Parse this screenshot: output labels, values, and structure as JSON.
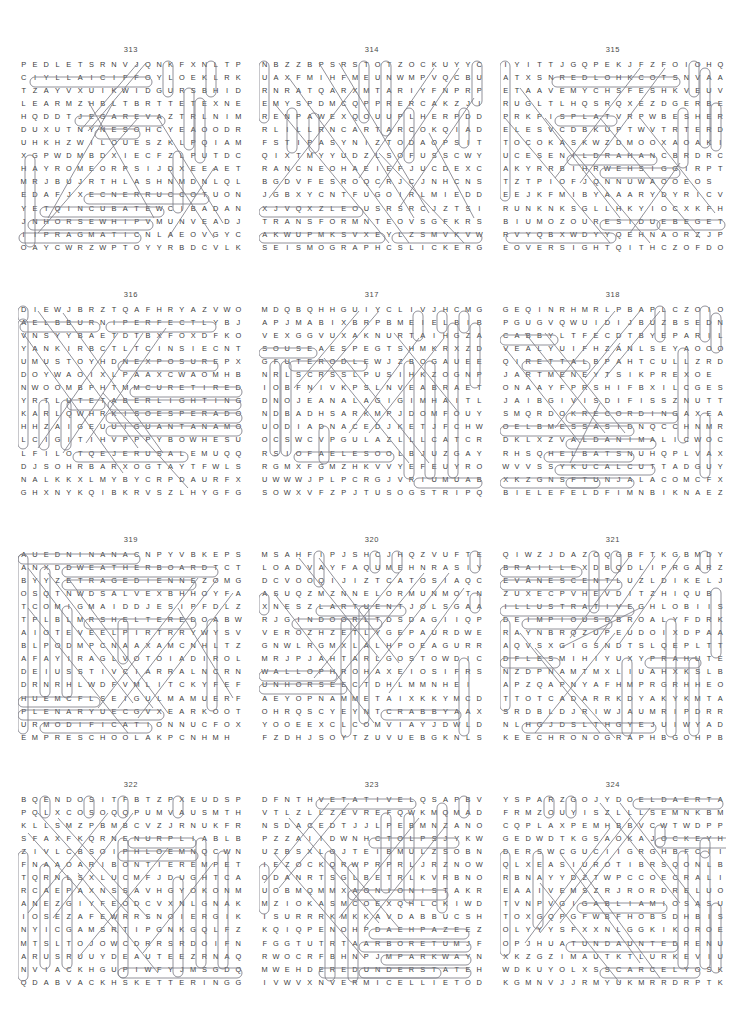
{
  "page": {
    "type": "word-search-puzzle-page",
    "columns": 3,
    "rows": 4,
    "grid_width": 20,
    "grid_height": 15
  },
  "puzzles": [
    {
      "number": "313",
      "rows": [
        "PEDLETSRNVJQNKFXNLTP",
        "CIYLLAICIFFOYLOEKLRK",
        "TZAYVXUIKWIDGURSBHID",
        "LEARMZHBLTBRTTETEXNE",
        "HQDDTJEGAREVAZTRLNIM",
        "DUXUTNYNESOHCYEAOODR",
        "UHKHZWILOUESZKLPQIAM",
        "XGPWDMBDXIECFZLPUTDC",
        "HAYROMEORPSIJDXEEAET",
        "MRJBUJRTHLASHNMDNLQL",
        "EDAFJXECNERRUCCOTUON",
        "YETQINCUBATEWCIBADAN",
        "JNHORSEWHIPVMUNVEADJ",
        "IIPRAGMATICNLAEOVGYC",
        "OAYCWRZWPTOYYRBDCVLK"
      ],
      "found_words": [
        "OFFICIALLY",
        "AVERAGE",
        "CHOSEN",
        "CURRENCE",
        "INCUBATE",
        "HORSEWHIP",
        "PRAGMATIC"
      ]
    },
    {
      "number": "314",
      "rows": [
        "NBZZBPSRSTOTZOCKUYYC",
        "UAXFMIHFMEUNWMPVQCBU",
        "RNRATQARXMTARIYFNPRP",
        "EMYSPDMCQPPRERCAKZJI",
        "RENPAWEXQOUUPLHERPDD",
        "RLILLRNCARTARCOKQIAD",
        "FSTIPASYNIZTODAOPSIT",
        "QIXTMYYUDZLSOFUSSCWY",
        "RANCNEOHAEIEFJUCDEXC",
        "BGDVFESROQCRJCJNHCNS",
        "JGBXYCNTFUGOIRLMIEDD",
        "XJVQXZLEOUSRSRCJZTSI",
        "TRANSFORMNTEOVSGFKRS",
        "AKWUPMKSVXEYLZSMVKVW",
        "SEISMOGRAPHCSLICKERG"
      ],
      "found_words": [
        "TRANSFORM",
        "SEISMOGRAPH",
        "SLICKER"
      ]
    },
    {
      "number": "315",
      "rows": [
        "IYITTJGQPEKJFZFOIOHQ",
        "ATXSNREDLOHKCOTSNVAA",
        "ETAAVEMYCHSFESHKVEUV",
        "RUGLTLHQSRQXEZDGERBE",
        "PRKPISPLATVRPWBESHER",
        "ELESVCDBKUPTWVTRTERD",
        "TOCOKASKWZDMOOXAOAKI",
        "UCESENILDRAHANCBRDRC",
        "AKYRRBIHRWEHSIGGIRPT",
        "TZTPIOFJQNNUWAOOEOS",
        "EEJKFMIBYAAARYDYRICV",
        "RUNKNKSGLLHKYIOCXKFH",
        "BIUMOZOURESIDUEBEGET",
        "RVYQBXWDYYQEHNAORZJP",
        "EOVERSIGHTQITHCZOFDO"
      ],
      "found_words": [
        "STOCKHOLDER",
        "SPLAT",
        "HARDLINES",
        "RIGGISH",
        "RESIDUE",
        "BEGET",
        "OVERSIGHT"
      ]
    },
    {
      "number": "316",
      "rows": [
        "DIEWJBRZTQAFHRYAZVWO",
        "AELBBURNIPERFECTLYBJ",
        "VNSYYBAETDTBXFOXDFKO",
        "YANKIRBCTLTCINSIECNT",
        "UMUSTOYHDNEXPOSUREPX",
        "DOYWAOIXLPAAXCWAOMHB",
        "NWOOMBPHTMMCURETIRED",
        "YRTLUTETABERLIGHTING",
        "KARLQWHRKISOESPERADO",
        "HHZAIGEUUIGUANTANAMO",
        "LCIGITIHVPPPYBOWHESU",
        "LFILOTQEJERUSALEMUQQ",
        "DJSOHRBARXOGTAYTFWLS",
        "NALKKXLMYBYCRPDAURFX",
        "GHXNYKQIBKRVSZLHYGFG"
      ],
      "found_words": [
        "RUBBLE",
        "PERFECTLY",
        "EXPOSURE",
        "RETIRED",
        "RATABLE",
        "LIGHTING",
        "DESPERADO",
        "GUANTANAMO",
        "JERUSALEM"
      ]
    },
    {
      "number": "317",
      "rows": [
        "MDQBQHHGUIYCLIVJHCMG",
        "APJMABIXBRPBMEIELBIB",
        "VEXGGVUXAKNURTAIHGZA",
        "SOUSEAESPEGTSHMKRXZD",
        "GFUTERODLEWJZBOGAUEE",
        "NRLSCRSSLPUSIHKZOGNP",
        "IOBFNIVKPSLNVEABRAET",
        "DNOJEANALAGIGIMHAITL",
        "NDBADHSARKMPJDOMFOUY",
        "UODIADNACEDJKETJFCHW",
        "OCSWCVPGULAZLLLCATCR",
        "RSIOFAELESOOLBJUZGAY",
        "RGMXFGMZHKVVYEFEUYRO",
        "UWWWJPLPCRGJVRIUMUAB",
        "SOWXVFZPJTUSOGSTRIPQ"
      ],
      "found_words": [
        "SOUSE",
        "TEROD",
        "LOOSELEAF",
        "STRIP",
        "BLEIB"
      ]
    },
    {
      "number": "318",
      "rows": [
        "GEQINRHMRLPBAPLCZOIO",
        "PGUGVQWUIDIJBUZBSEDN",
        "CABBYLTFECDTBYEPARIL",
        "VEALYUIFHZANLSEYAOOO",
        "QIRETTALBPAHTCULLZRD",
        "JARTMENEYTSIKPREXOE",
        "ONAAYFPRSHIFBXILCGES",
        "JAIBGIVISDIFISSZNUTT",
        "SMQRDOKRECORDINGAXEA",
        "OELBMESSASIDNQCCHNMR",
        "DKLXZVALDANIMALICWOC",
        "RHSQHELBATSNUHQPLVAX",
        "WVVSSYKUCALCUTTADGUY",
        "XKZGNSFTUNJALACOMCFX",
        "BIELEFELDFIMNBIKNAEZ"
      ],
      "found_words": [
        "CABBY",
        "RATTLE",
        "RECORDING",
        "DISASSEMBLE",
        "ANIMAL",
        "UNSTABLE",
        "CALCUTTA",
        "TUNJA",
        "BIELEFELD"
      ]
    },
    {
      "number": "319",
      "rows": [
        "AUEDNINANACNPYVBKEPS",
        "ANXDDWEATHERBOARDTCT",
        "BYYZETRAGEDIENNEZOMG",
        "OSQTNWDSALVEXBHHOYFA",
        "TCOMIGMAIDDJESIPFDLZ",
        "TPLBLMRSHELTEREDOABW",
        "AIOTEVEELPIRTRRYWYSV",
        "BLPODMPCNAAXAMCNHLTZ",
        "AFAYIRAGLVOTOIADIROL",
        "DEIUSSTIVCIARRALNCRN",
        "DRNRHLWDFVMLITCKYFEF",
        "HUEMCFLSEIGULMAMUERF",
        "PLENARYUECGVXEARKOOT",
        "URMODIFICATIONNUCFOX",
        "EMPRESCHOOLAKPCNHMH"
      ],
      "found_words": [
        "ANANINDEUA",
        "WEATHERBOARD",
        "TRAGEDIENNE",
        "SHELTERED",
        "PLENARY",
        "MODIFICATION",
        "PRESCHOOL"
      ]
    },
    {
      "number": "320",
      "rows": [
        "MSAHFIPJSHCJHQZVUFTE",
        "LOADVAYFAQUMEHNRASIY",
        "DCVOOQIJIZTCATOSIAQC",
        "ASUQZMZNNELORMUNMOTN",
        "XNESZLARTUENTJOLSGAA",
        "RJGINDOORLTDSDAGIIQP",
        "VEROZHZETLYGEPAURDWE",
        "GNWLRGMXLALHPOEAGURR",
        "MRJPJAHTARLGOSTOWDIC",
        "WALLOPHROHAXEIOSIFRS",
        "UNHORSEECTDHLMMNHEI",
        "AEYOPNAMMETAIXKKYMCD",
        "OHRQSCYEYNTCRABBYAAX",
        "YOOEEXCLCOMVIAYJDWLD",
        "FZDHJSOYTZUVUEBGKNLS"
      ],
      "found_words": [
        "NEUTRAL",
        "INDOOR",
        "WALLOP",
        "UNHORSE",
        "CRABBY"
      ]
    },
    {
      "number": "321",
      "rows": [
        "QIWZJDAZOQGBFTKGBMDY",
        "BRAILLEXDBQDLIPRGARZ",
        "EVANESCENTLUZLDIKELJ",
        "ZUXECPVHEVDITZHIQUB",
        "ILLUSTRATIVEGHLOBIIS",
        "DEIMPIOUSDBROALYFDRK",
        "RAYNBRQZUPEUDOIXDPAA",
        "AQVSXGIGSNDTSLQEPLTT",
        "DFLESMIHIYUXYPRAHUTE",
        "NZDPNAMTMXLIUAHXKSLB",
        "APZQAPNYAFHMPRGRHHEO",
        "TTOTCADARRKDYAKYKMTA",
        "SRDBLDJRIWJAUMRIPDRR",
        "NLHGJDSLTHGYEJUIWYAD",
        "KEECHRONOGRAPHBGOHPB"
      ],
      "found_words": [
        "BRAILLE",
        "EVANESCENT",
        "ILLUSTRATIVE",
        "IMPIOUS",
        "HIMSELF",
        "HARPY",
        "CHRONOGRAPH"
      ]
    },
    {
      "number": "322",
      "rows": [
        "BQENDOSITFBTZPXEUDSP",
        "PQLXCOSOQQPUMVAUSMTH",
        "KLLSMZPBMBCVZJRNUKFR",
        "SFAXFKQRNENURPLIABLB",
        "ZIVLCBSOIPHLOEMNQCWN",
        "FNAAOARIBONTIEREMPET",
        "TQRNLSXLUCMFJDUGHTCA",
        "RCAEPAXNSSAVHGYOKONM",
        "ANEZGIYFEODCVXNLGNAK",
        "IOSEZAFEWRRSNOIERGIK",
        "NYICGAMSRTIPGNKGQLFZ",
        "MTSLTOJOWCDRRSRDOIFN",
        "ARUSRUUYDEAUTEEZRNAQ",
        "NVIACKHGUPIWFYJMSGDQ",
        "QDABVACKHSKETTERINGG"
      ],
      "found_words": [
        "PRUNE",
        "PHLOEM",
        "FRONTIER",
        "KETTERING",
        "PLIABLE"
      ]
    },
    {
      "number": "323",
      "rows": [
        "DFNTHVETATIVELQSAPBV",
        "VTLZLLZEVREFQWKMQMAD",
        "NSDACEDTJJLPEBMNZANO",
        "PZZAIIDWNHCTOLPSJYKW",
        "UZBSXLOJTEIBMULZSOBN",
        "IEZOCKQRWPRPRLJRZNOW",
        "ODANRTSGLBETRLKVRBNOA",
        "UOBMQMMXAONIONISTAKR",
        "MZIOKASMCOEXQHLCKIWD",
        "ISURRRKMKKAVDABBUCSHB",
        "KQIQPENOHPDAEHPAZEEZ",
        "FGGTUTRTAARBORETUMJF",
        "RWOCRFBHNPJMPARKWAYN",
        "MWEHDEREDUNDERSTATEH",
        "IVWVXNVERMICELLIETOD"
      ],
      "found_words": [
        "VEGETATIVE",
        "SPLOTCH",
        "UNIONIST",
        "HEADPHONE",
        "ARBORETUM",
        "PARKWAY",
        "UNDERSTATE",
        "VERMICELLI"
      ]
    },
    {
      "number": "324",
      "rows": [
        "YSPARZGOJYDOELDAERTA",
        "FRMZOUYISZLLLSEMNKBM",
        "CQPLAXPEMHBBVCWTWDPP",
        "GEDWDTKGSAOKAJOCKEYH",
        "DERSWCGUCIIGRGHBFCII",
        "QLXEASIUROTIBRSQONLB",
        "RBNAYYDZTWPCCOECRALI",
        "EAAIVEMSZRJRORDRELUO",
        "TVNPVGIGABLIAMIOSASU",
        "TOXGQPGFWBFHOBSDHBIS",
        "OLYYYSFXXNLGGKIKOROE",
        "OPJHUATUNDAUNTEDRENU",
        "XKZGZIMAUTKTLURKEVIU",
        "WDKUYOLXSSCARCELYOSK",
        "KGMNVJJRMYUKMRRDRPTK"
      ],
      "found_words": [
        "TREADLE",
        "JOCKEY",
        "MAILBAG",
        "UNDAUNTED",
        "SCARCELY"
      ]
    }
  ]
}
